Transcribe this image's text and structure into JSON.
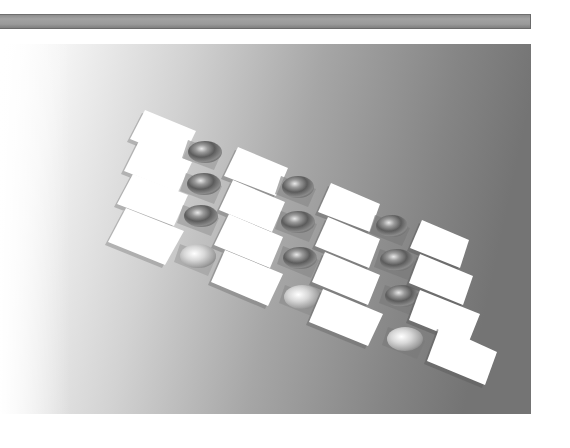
{
  "header_bar": {
    "color": "#9a9a9a"
  },
  "render": {
    "description": "3D-rendered array of white square tiles with reflective spheres between tile columns",
    "background": {
      "gradient_left": "#ffffff",
      "gradient_right": "#747474"
    },
    "tile_color": "#ffffff",
    "tile_columns": 4,
    "tiles_per_column": 4,
    "sphere_columns": 3,
    "spheres_per_column": 4,
    "sphere_count": 12,
    "tile_count": 16
  }
}
